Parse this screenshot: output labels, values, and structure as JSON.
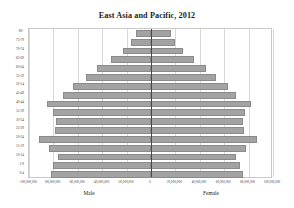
{
  "chart_data": {
    "type": "bar",
    "orientation": "horizontal",
    "subtype": "population-pyramid",
    "title": "East Asia and Pacific, 2012",
    "xlabel": "",
    "ylabel": "",
    "xlim": [
      -100000000,
      100000000
    ],
    "grid": true,
    "legend_position": "below-axis",
    "categories": [
      "80+",
      "75-79",
      "70-74",
      "65-69",
      "60-64",
      "55-59",
      "50-54",
      "45-49",
      "40-44",
      "35-39",
      "30-34",
      "25-29",
      "20-24",
      "15-19",
      "10-14",
      "5-9",
      "0-4"
    ],
    "x_tick_labels": [
      "-100,000,000",
      "-80,000,000",
      "-60,000,000",
      "-40,000,000",
      "-20,000,000",
      "0",
      "20,000,000",
      "40,000,000",
      "60,000,000",
      "80,000,000",
      "100,000,000"
    ],
    "x_tick_values": [
      -100000000,
      -80000000,
      -60000000,
      -40000000,
      -20000000,
      0,
      20000000,
      40000000,
      60000000,
      80000000,
      100000000
    ],
    "series": [
      {
        "name": "Male",
        "side": "left",
        "values": [
          12000000,
          16000000,
          23000000,
          33000000,
          44000000,
          53000000,
          64000000,
          72000000,
          85000000,
          80000000,
          78000000,
          79000000,
          92000000,
          84000000,
          76000000,
          80000000,
          82000000
        ]
      },
      {
        "name": "Female",
        "side": "right",
        "values": [
          16000000,
          20000000,
          26000000,
          35000000,
          45000000,
          53000000,
          63000000,
          70000000,
          82000000,
          77000000,
          75000000,
          76000000,
          87000000,
          78000000,
          70000000,
          73000000,
          75000000
        ]
      }
    ],
    "colors": {
      "bar_fill": "#a3a3a3",
      "bar_stroke": "#8a8a8a",
      "gridline": "#d8d8d8",
      "zero_axis": "#4a4a4a",
      "plot_border": "#c9c9c9",
      "text": "#1d1d1d",
      "background": "#ffffff"
    }
  }
}
